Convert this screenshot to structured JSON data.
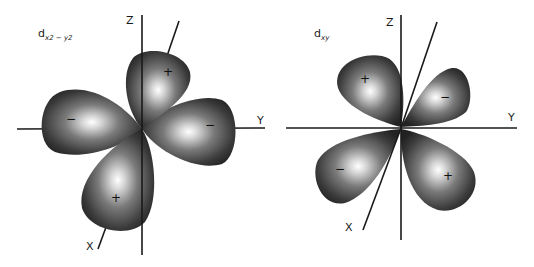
{
  "diagrams": [
    {
      "id": "dx2-y2",
      "title": {
        "main": "d",
        "sub": "x2 − y2"
      },
      "axes": {
        "z": "Z",
        "y": "Y",
        "x": "X"
      },
      "lobes": [
        {
          "position": "top",
          "sign": "+"
        },
        {
          "position": "left",
          "sign": "−"
        },
        {
          "position": "right",
          "sign": "−"
        },
        {
          "position": "bottom",
          "sign": "+"
        }
      ]
    },
    {
      "id": "dxy",
      "title": {
        "main": "d",
        "sub": "xy"
      },
      "axes": {
        "z": "Z",
        "y": "Y",
        "x": "X"
      },
      "lobes": [
        {
          "position": "upper-left",
          "sign": "+"
        },
        {
          "position": "upper-right",
          "sign": "−"
        },
        {
          "position": "lower-left",
          "sign": "−"
        },
        {
          "position": "lower-right",
          "sign": "+"
        }
      ]
    }
  ],
  "colors": {
    "lobe_dark": "#2b2b2b",
    "lobe_mid": "#7a7a7a",
    "lobe_highlight": "#ffffff",
    "axis": "#1a1a1a",
    "background": "#ffffff"
  }
}
